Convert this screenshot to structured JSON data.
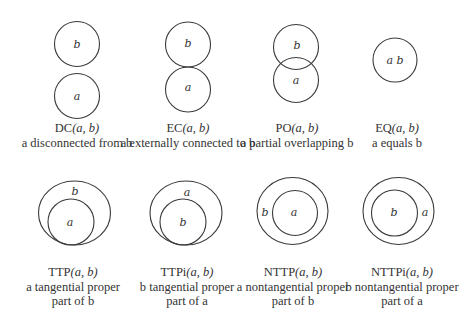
{
  "relations": [
    {
      "id": "dc",
      "name": "DC",
      "args": "(a, b)",
      "desc": [
        "a disconnected from b"
      ]
    },
    {
      "id": "ec",
      "name": "EC",
      "args": "(a, b)",
      "desc": [
        "a externally connected to b"
      ]
    },
    {
      "id": "po",
      "name": "PO",
      "args": "(a, b)",
      "desc": [
        "a partial overlapping b"
      ]
    },
    {
      "id": "eq",
      "name": "EQ",
      "args": "(a, b)",
      "desc": [
        "a equals b"
      ]
    },
    {
      "id": "ttp",
      "name": "TTP",
      "args": "(a, b)",
      "desc": [
        "a tangential proper",
        "part of b"
      ]
    },
    {
      "id": "ttpi",
      "name": "TTPi",
      "args": "(a, b)",
      "desc": [
        "b tangential proper",
        "part of a"
      ]
    },
    {
      "id": "nttp",
      "name": "NTTP",
      "args": "(a, b)",
      "desc": [
        "a nontangential proper",
        "part of b"
      ]
    },
    {
      "id": "nttpi",
      "name": "NTTPi",
      "args": "(a, b)",
      "desc": [
        "b nontangential proper",
        "part of a"
      ]
    }
  ],
  "labels": {
    "dc": {
      "top": "b",
      "bottom": "a"
    },
    "ec": {
      "top": "b",
      "bottom": "a"
    },
    "po": {
      "top": "b",
      "bottom": "a"
    },
    "eq": {
      "both": "a b"
    },
    "ttp": {
      "outer": "b",
      "inner": "a"
    },
    "ttpi": {
      "outer": "a",
      "inner": "b"
    },
    "nttp": {
      "outer": "b",
      "inner": "a"
    },
    "nttpi": {
      "outer": "a",
      "inner": "b"
    }
  }
}
